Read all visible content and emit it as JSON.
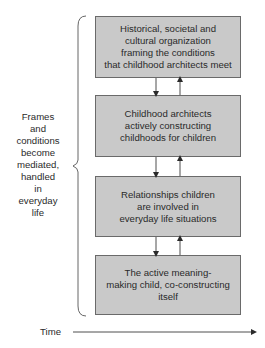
{
  "diagram": {
    "boxes": [
      {
        "id": "historical-organization",
        "text": "Historical, societal and\ncultural organization\nframing the conditions\nthat childhood architects meet"
      },
      {
        "id": "childhood-architects",
        "text": "Childhood architects\nactively constructing\nchildhoods for children"
      },
      {
        "id": "relationships",
        "text": "Relationships children\nare involved in\neveryday life situations"
      },
      {
        "id": "meaning-making-child",
        "text": "The active meaning-\nmaking child, co-constructing\nitself"
      }
    ],
    "connectors": [
      {
        "between": [
          "historical-organization",
          "childhood-architects"
        ],
        "arrows": [
          "down",
          "up"
        ]
      },
      {
        "between": [
          "childhood-architects",
          "relationships"
        ],
        "arrows": [
          "down",
          "up"
        ]
      },
      {
        "between": [
          "relationships",
          "meaning-making-child"
        ],
        "arrows": [
          "down",
          "up"
        ]
      }
    ],
    "brace_label": "Frames\nand\nconditions\nbecome\nmediated,\nhandled\nin\neveryday\nlife",
    "time_axis": {
      "label": "Time",
      "direction": "right"
    },
    "colors": {
      "box_fill": "#c9c9c9",
      "box_border": "#6a6a6a",
      "line": "#3a3a3a",
      "text": "#2a2a2a"
    }
  }
}
